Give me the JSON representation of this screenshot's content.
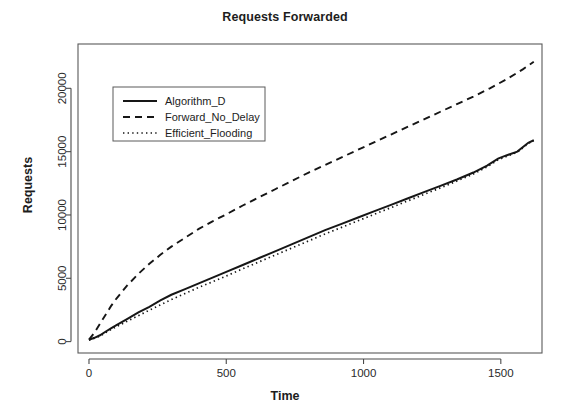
{
  "chart_data": {
    "type": "line",
    "title": "Requests Forwarded",
    "xlabel": "Time",
    "ylabel": "Requests",
    "xlim": [
      -40,
      1650
    ],
    "ylim": [
      -900,
      23500
    ],
    "xticks": [
      0,
      500,
      1000,
      1500
    ],
    "xtick_labels": [
      "0",
      "500",
      "1000",
      "1500"
    ],
    "yticks": [
      0,
      5000,
      10000,
      15000,
      20000
    ],
    "ytick_labels": [
      "0",
      "5000",
      "10000",
      "15000",
      "20000"
    ],
    "grid": false,
    "legend_position": "upper-left-inside",
    "series": [
      {
        "name": "Algorithm_D",
        "style": "solid",
        "color": "#161616",
        "x": [
          0,
          20,
          40,
          60,
          80,
          100,
          140,
          180,
          220,
          260,
          300,
          350,
          400,
          450,
          500,
          560,
          620,
          680,
          740,
          800,
          860,
          920,
          980,
          1040,
          1100,
          1160,
          1220,
          1280,
          1340,
          1400,
          1450,
          1490,
          1520,
          1560,
          1600,
          1620
        ],
        "y": [
          150,
          300,
          500,
          780,
          1050,
          1300,
          1800,
          2300,
          2750,
          3250,
          3700,
          4150,
          4600,
          5050,
          5500,
          6050,
          6600,
          7150,
          7700,
          8250,
          8800,
          9300,
          9800,
          10300,
          10800,
          11300,
          11800,
          12300,
          12800,
          13350,
          13900,
          14450,
          14700,
          15000,
          15700,
          15900
        ]
      },
      {
        "name": "Forward_No_Delay",
        "style": "dashed",
        "color": "#161616",
        "x": [
          0,
          20,
          40,
          60,
          80,
          100,
          140,
          180,
          220,
          260,
          300,
          350,
          400,
          450,
          500,
          560,
          620,
          680,
          740,
          800,
          860,
          920,
          980,
          1040,
          1100,
          1160,
          1220,
          1280,
          1340,
          1400,
          1460,
          1520,
          1580,
          1620
        ],
        "y": [
          150,
          700,
          1400,
          2100,
          2800,
          3400,
          4450,
          5350,
          6150,
          6850,
          7500,
          8200,
          8900,
          9500,
          10050,
          10750,
          11400,
          12050,
          12700,
          13350,
          13950,
          14550,
          15150,
          15750,
          16350,
          16950,
          17550,
          18150,
          18750,
          19350,
          20000,
          20700,
          21500,
          22100
        ]
      },
      {
        "name": "Efficient_Flooding",
        "style": "dotted",
        "color": "#161616",
        "x": [
          0,
          20,
          40,
          60,
          80,
          100,
          140,
          180,
          220,
          260,
          300,
          350,
          400,
          450,
          500,
          560,
          620,
          680,
          740,
          800,
          860,
          920,
          980,
          1040,
          1100,
          1160,
          1220,
          1280,
          1340,
          1400,
          1450,
          1490,
          1520,
          1560,
          1600,
          1620
        ],
        "y": [
          120,
          260,
          440,
          700,
          950,
          1180,
          1620,
          2050,
          2480,
          2900,
          3320,
          3800,
          4280,
          4720,
          5180,
          5750,
          6300,
          6850,
          7400,
          7950,
          8500,
          9020,
          9540,
          10060,
          10580,
          11100,
          11620,
          12140,
          12680,
          13230,
          13800,
          14350,
          14620,
          14950,
          15650,
          15880
        ]
      }
    ]
  },
  "legend": {
    "entries": [
      {
        "label": "Algorithm_D",
        "style": "solid"
      },
      {
        "label": "Forward_No_Delay",
        "style": "dashed"
      },
      {
        "label": "Efficient_Flooding",
        "style": "dotted"
      }
    ]
  }
}
